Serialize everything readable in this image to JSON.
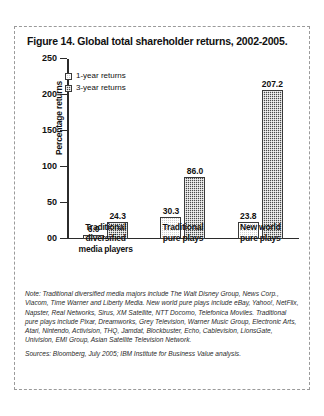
{
  "figure": {
    "title": "Figure 14. Global total shareholder returns, 2002-2005.",
    "note": "Note: Traditional diversified media majors include The Walt Disney Group, News Corp., Viacom, Time Warner and Liberty Media. New world pure plays include eBay, Yahoo!, NetFlix, Napster, Real Networks, Sirus, XM Satellite, NTT Docomo, Telefonica Moviles. Traditional pure plays include Pixar, Dreamworks, Grey Television, Warner Music Group, Electronic Arts, Atari, Nintendo, Activision, THQ, Jamdat, Blockbuster, Echo, Cablevision, LionsGate, Univision, EMI Group, Asian Satellite Television Network.",
    "sources": "Sources: Bloomberg, July 2005; IBM Institute for Business Value analysis."
  },
  "chart_data": {
    "type": "bar",
    "title": "Figure 14. Global total shareholder returns, 2002-2005.",
    "xlabel": "",
    "ylabel": "Percentage returns",
    "ylim": [
      0,
      250
    ],
    "yticks": [
      0,
      50,
      100,
      150,
      200,
      250
    ],
    "ytick_labels": [
      "00",
      "50",
      "100",
      "150",
      "200",
      "250"
    ],
    "grid": false,
    "legend_position": "upper-left-inside",
    "categories": [
      "Traditional diversified media players",
      "Traditional pure plays",
      "New world pure plays"
    ],
    "category_lines": [
      [
        "Traditional",
        "diversified",
        "media players"
      ],
      [
        "Traditional",
        "pure plays"
      ],
      [
        "New world",
        "pure plays"
      ]
    ],
    "series": [
      {
        "name": "1-year returns",
        "values": [
          6.0,
          30.3,
          23.8
        ],
        "value_labels": [
          "6.0",
          "30.3",
          "23.8"
        ],
        "fill": "light-dotted",
        "color": "#cfcfcf"
      },
      {
        "name": "3-year returns",
        "values": [
          24.3,
          86.0,
          207.2
        ],
        "value_labels": [
          "24.3",
          "86.0",
          "207.2"
        ],
        "fill": "dark-checkered",
        "color": "#4a4a4a"
      }
    ]
  }
}
